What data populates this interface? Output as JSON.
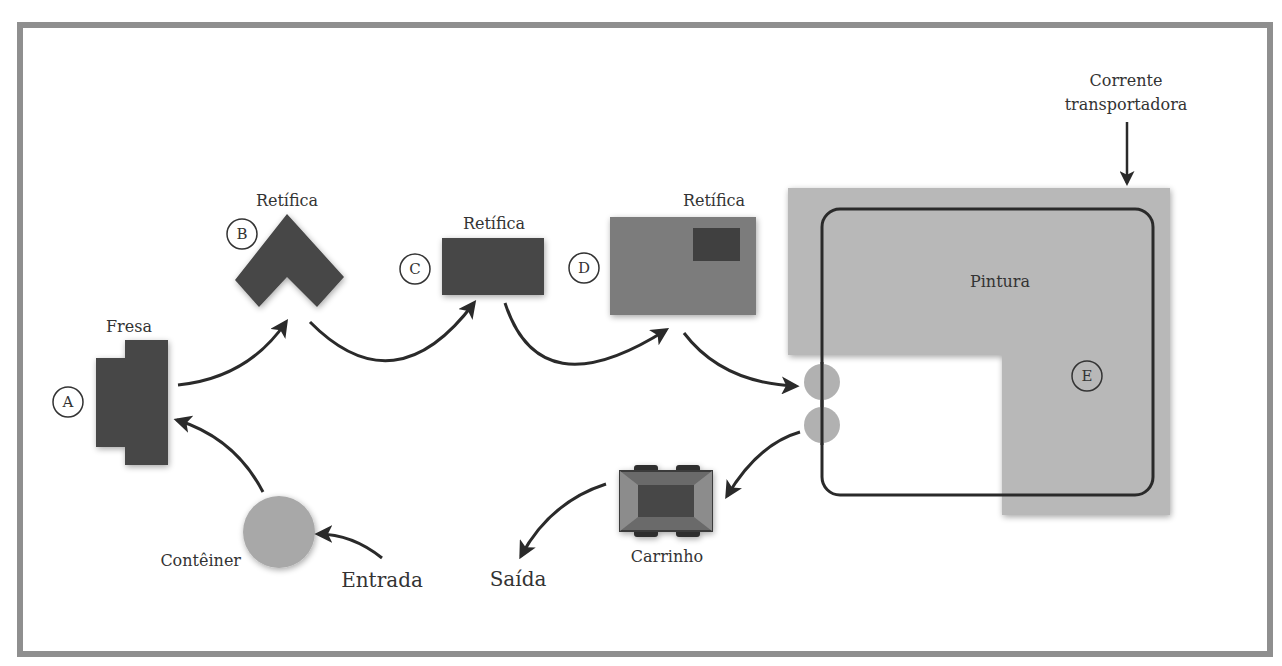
{
  "diagram": {
    "colors": {
      "frame": "#8f8f8f",
      "machine_dark": "#464646",
      "machine_mid": "#7c7c7c",
      "paint_area": "#b8b8b8",
      "container": "#a8a8a8",
      "arrow": "#2a2a2a",
      "text": "#333333"
    },
    "stations": {
      "fresa": {
        "marker": "A",
        "label": "Fresa"
      },
      "retifica_b": {
        "marker": "B",
        "label": "Retífica"
      },
      "retifica_c": {
        "marker": "C",
        "label": "Retífica"
      },
      "retifica_d": {
        "marker": "D",
        "label": "Retífica"
      },
      "pintura": {
        "marker": "E",
        "label": "Pintura"
      }
    },
    "labels": {
      "conveyor": [
        "Corrente",
        "transportadora"
      ],
      "container": "Contêiner",
      "entry": "Entrada",
      "cart": "Carrinho",
      "exit": "Saída"
    },
    "flow": [
      "Entrada",
      "Contêiner",
      "Fresa",
      "Retífica (B)",
      "Retífica (C)",
      "Retífica (D)",
      "Pintura",
      "Carrinho",
      "Saída"
    ]
  }
}
